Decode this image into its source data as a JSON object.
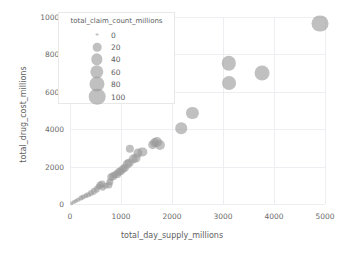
{
  "chart_data": {
    "type": "scatter",
    "title": "",
    "subtitle": "",
    "xlabel": "total_day_supply_millions",
    "ylabel": "total_drug_cost_millions",
    "xlim": [
      0,
      5000
    ],
    "ylim": [
      0,
      10000
    ],
    "xticks": [
      "0",
      "1000",
      "2000",
      "3000",
      "4000",
      "5000"
    ],
    "xtick_values": [
      0,
      1000,
      2000,
      3000,
      4000,
      5000
    ],
    "yticks": [
      "0",
      "2000",
      "4000",
      "6000",
      "8000",
      "10000"
    ],
    "ytick_values": [
      0,
      2000,
      4000,
      6000,
      8000,
      10000
    ],
    "grid": true,
    "marker_color": "#9a9a9a",
    "marker_opacity": 0.62,
    "size_encoding": "total_claim_count_millions",
    "points": [
      {
        "x": 30,
        "y": 60,
        "s": 1
      },
      {
        "x": 70,
        "y": 110,
        "s": 2
      },
      {
        "x": 110,
        "y": 170,
        "s": 2
      },
      {
        "x": 160,
        "y": 230,
        "s": 3
      },
      {
        "x": 210,
        "y": 300,
        "s": 4
      },
      {
        "x": 260,
        "y": 360,
        "s": 4
      },
      {
        "x": 310,
        "y": 430,
        "s": 5
      },
      {
        "x": 360,
        "y": 500,
        "s": 6
      },
      {
        "x": 420,
        "y": 600,
        "s": 7
      },
      {
        "x": 470,
        "y": 680,
        "s": 8
      },
      {
        "x": 520,
        "y": 780,
        "s": 9
      },
      {
        "x": 560,
        "y": 930,
        "s": 10
      },
      {
        "x": 580,
        "y": 1000,
        "s": 11
      },
      {
        "x": 620,
        "y": 1080,
        "s": 11
      },
      {
        "x": 640,
        "y": 870,
        "s": 9
      },
      {
        "x": 700,
        "y": 980,
        "s": 10
      },
      {
        "x": 760,
        "y": 1020,
        "s": 12
      },
      {
        "x": 790,
        "y": 1180,
        "s": 12
      },
      {
        "x": 800,
        "y": 1420,
        "s": 13
      },
      {
        "x": 850,
        "y": 1500,
        "s": 14
      },
      {
        "x": 880,
        "y": 1560,
        "s": 14
      },
      {
        "x": 920,
        "y": 1600,
        "s": 15
      },
      {
        "x": 960,
        "y": 1700,
        "s": 16
      },
      {
        "x": 1000,
        "y": 1790,
        "s": 17
      },
      {
        "x": 1040,
        "y": 1860,
        "s": 17
      },
      {
        "x": 1080,
        "y": 1950,
        "s": 18
      },
      {
        "x": 1120,
        "y": 2120,
        "s": 19
      },
      {
        "x": 1160,
        "y": 2200,
        "s": 20
      },
      {
        "x": 1180,
        "y": 2950,
        "s": 18
      },
      {
        "x": 1240,
        "y": 2380,
        "s": 21
      },
      {
        "x": 1300,
        "y": 2480,
        "s": 22
      },
      {
        "x": 1340,
        "y": 2740,
        "s": 23
      },
      {
        "x": 1420,
        "y": 2780,
        "s": 24
      },
      {
        "x": 1620,
        "y": 3180,
        "s": 27
      },
      {
        "x": 1660,
        "y": 3280,
        "s": 28
      },
      {
        "x": 1700,
        "y": 3300,
        "s": 29
      },
      {
        "x": 1760,
        "y": 3180,
        "s": 30
      },
      {
        "x": 2180,
        "y": 4050,
        "s": 42
      },
      {
        "x": 2400,
        "y": 4850,
        "s": 48
      },
      {
        "x": 3110,
        "y": 7530,
        "s": 72
      },
      {
        "x": 3120,
        "y": 6480,
        "s": 66
      },
      {
        "x": 3760,
        "y": 6980,
        "s": 78
      },
      {
        "x": 4900,
        "y": 9650,
        "s": 105
      }
    ],
    "legend": {
      "title": "total_claim_count_millions",
      "position": "upper-left-inside",
      "entries": [
        {
          "label": "0",
          "value": 0
        },
        {
          "label": "20",
          "value": 20
        },
        {
          "label": "40",
          "value": 40
        },
        {
          "label": "60",
          "value": 60
        },
        {
          "label": "80",
          "value": 80
        },
        {
          "label": "100",
          "value": 100
        }
      ]
    }
  }
}
